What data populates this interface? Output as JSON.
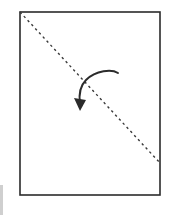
{
  "figure": {
    "canvas": {
      "width": 171,
      "height": 219,
      "background_color": "#ffffff"
    },
    "sheet": {
      "label": "paper sheet outline",
      "x": 20,
      "y": 12,
      "width": 140,
      "height": 183,
      "stroke_color": "#2b2b2b",
      "stroke_width": 1.6,
      "fill_color": "#ffffff"
    },
    "fold_line": {
      "label": "diagonal fold crease",
      "style": "dashed",
      "x1": 20,
      "y1": 12,
      "x2": 160,
      "y2": 163,
      "stroke_color": "#3a3a3a",
      "stroke_width": 1.4,
      "dash_length": 2.4,
      "gap_length": 3.2
    },
    "fold_arrow": {
      "label": "fold direction arrow",
      "path": "M 118 73 C 112 69, 96 70, 86 80 C 79 87, 79 97, 80 104",
      "tip_x": 80,
      "tip_y": 111,
      "stroke_color": "#2b2b2b",
      "stroke_width": 2.0,
      "head_points": "80,111 74,98 86,100"
    },
    "edge_artifact": {
      "label": "cropped neighbouring figure edge",
      "x": 0,
      "y": 185,
      "width": 3,
      "height": 30,
      "color": "#cfcfcf"
    }
  }
}
